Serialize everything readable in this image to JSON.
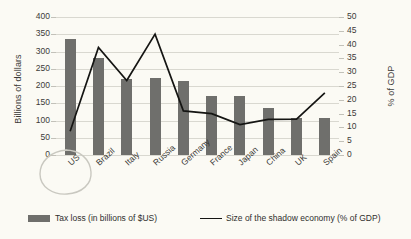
{
  "chart_data": {
    "type": "bar",
    "title": "",
    "subtitle": "",
    "categories": [
      "US",
      "Brazil",
      "Italy",
      "Russia",
      "Germany",
      "France",
      "Japan",
      "China",
      "UK",
      "Spain"
    ],
    "series": [
      {
        "name": "Tax loss (in billions of $US)",
        "type": "bar",
        "axis": "left",
        "color": "#6f6f6c",
        "values": [
          337,
          280,
          221,
          222,
          215,
          172,
          172,
          135,
          108,
          107
        ]
      },
      {
        "name": "Size of the shadow economy (% of GDP)",
        "type": "line",
        "axis": "right",
        "color": "#151513",
        "values": [
          8.6,
          39.0,
          27.0,
          43.8,
          16.0,
          15.0,
          11.0,
          12.9,
          13.0,
          22.5
        ]
      }
    ],
    "xlabel": "",
    "ylabel": "Billions of dollars",
    "y2label": "% of GDP",
    "ylim": [
      0,
      400
    ],
    "y2lim": [
      0,
      50
    ],
    "yticks": [
      0,
      50,
      100,
      150,
      200,
      250,
      300,
      350,
      400
    ],
    "y2ticks": [
      0,
      5,
      10,
      15,
      20,
      25,
      30,
      35,
      40,
      45,
      50
    ],
    "grid": true,
    "legend_position": "bottom"
  },
  "axes": {
    "left_title": "Billions of dollars",
    "right_title": "% of GDP",
    "left_ticks": [
      "400",
      "350",
      "300",
      "250",
      "200",
      "150",
      "100",
      "50",
      "0"
    ],
    "right_ticks": [
      "50",
      "45",
      "40",
      "35",
      "30",
      "25",
      "20",
      "15",
      "10",
      "5",
      "0"
    ]
  },
  "legend": {
    "bar_label": "Tax loss (in billions of $US)",
    "line_label": "Size of the shadow economy (% of GDP)"
  },
  "annotations": {
    "highlight_shape": "hand-drawn-oval",
    "highlight_target": "US",
    "highlight_color": "#c9c8c0"
  },
  "colors": {
    "bar": "#6f6f6c",
    "line": "#151513",
    "background": "#fbfaf4",
    "gridline": "#d9d8d0",
    "text": "#3b3b38"
  }
}
